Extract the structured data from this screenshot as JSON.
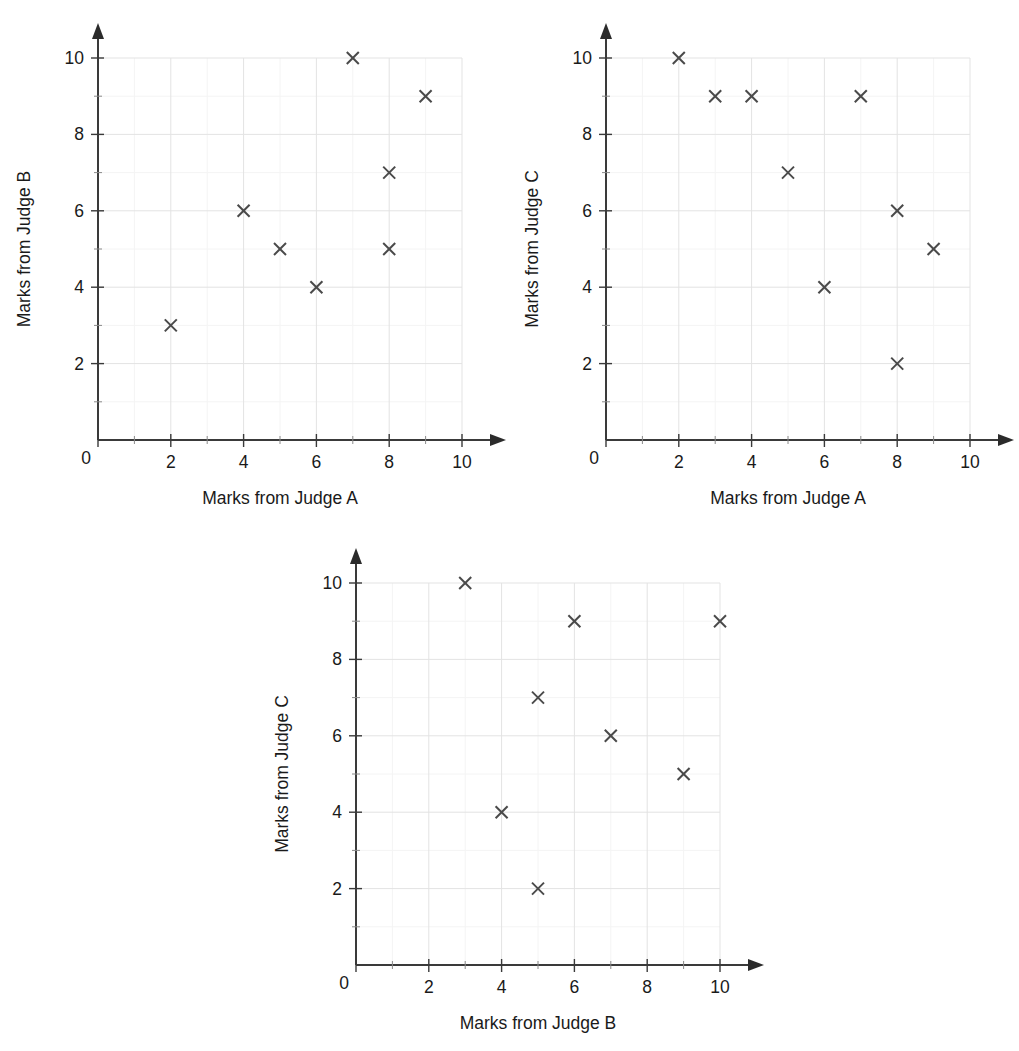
{
  "page": {
    "background": "#ffffff",
    "marker_color": "#4a4a4a",
    "axis_color": "#3a3a3a",
    "grid_major_color": "#e3e3e3",
    "grid_minor_color": "#f4f4f4",
    "text_color": "#1a1a1a"
  },
  "chart_data": [
    {
      "id": "chart-judge-a-vs-b",
      "type": "scatter",
      "title": "",
      "xlabel": "Marks from Judge A",
      "ylabel": "Marks from Judge B",
      "xlim": [
        0,
        10
      ],
      "ylim": [
        0,
        10
      ],
      "xticks": [
        0,
        2,
        4,
        6,
        8,
        10
      ],
      "yticks": [
        0,
        2,
        4,
        6,
        8,
        10
      ],
      "xtick_labels": [
        "0",
        "2",
        "4",
        "6",
        "8",
        "10"
      ],
      "ytick_labels": [
        "0",
        "2",
        "4",
        "6",
        "8",
        "10"
      ],
      "minor_ticks": [
        1,
        3,
        5,
        7,
        9
      ],
      "grid": true,
      "legend": "none",
      "marker": "x",
      "origin_label": "0",
      "points": [
        {
          "x": 2,
          "y": 3
        },
        {
          "x": 4,
          "y": 6
        },
        {
          "x": 5,
          "y": 5
        },
        {
          "x": 6,
          "y": 4
        },
        {
          "x": 7,
          "y": 10
        },
        {
          "x": 8,
          "y": 5
        },
        {
          "x": 8,
          "y": 7
        },
        {
          "x": 9,
          "y": 9
        }
      ]
    },
    {
      "id": "chart-judge-a-vs-c",
      "type": "scatter",
      "title": "",
      "xlabel": "Marks from Judge A",
      "ylabel": "Marks from Judge C",
      "xlim": [
        0,
        10
      ],
      "ylim": [
        0,
        10
      ],
      "xticks": [
        0,
        2,
        4,
        6,
        8,
        10
      ],
      "yticks": [
        0,
        2,
        4,
        6,
        8,
        10
      ],
      "xtick_labels": [
        "0",
        "2",
        "4",
        "6",
        "8",
        "10"
      ],
      "ytick_labels": [
        "0",
        "2",
        "4",
        "6",
        "8",
        "10"
      ],
      "minor_ticks": [
        1,
        3,
        5,
        7,
        9
      ],
      "grid": true,
      "legend": "none",
      "marker": "x",
      "origin_label": "0",
      "points": [
        {
          "x": 2,
          "y": 10
        },
        {
          "x": 3,
          "y": 9
        },
        {
          "x": 4,
          "y": 9
        },
        {
          "x": 5,
          "y": 7
        },
        {
          "x": 6,
          "y": 4
        },
        {
          "x": 7,
          "y": 9
        },
        {
          "x": 8,
          "y": 6
        },
        {
          "x": 8,
          "y": 2
        },
        {
          "x": 9,
          "y": 5
        }
      ]
    },
    {
      "id": "chart-judge-b-vs-c",
      "type": "scatter",
      "title": "",
      "xlabel": "Marks from Judge B",
      "ylabel": "Marks from Judge C",
      "xlim": [
        0,
        10
      ],
      "ylim": [
        0,
        10
      ],
      "xticks": [
        0,
        2,
        4,
        6,
        8,
        10
      ],
      "yticks": [
        0,
        2,
        4,
        6,
        8,
        10
      ],
      "xtick_labels": [
        "0",
        "2",
        "4",
        "6",
        "8",
        "10"
      ],
      "ytick_labels": [
        "0",
        "2",
        "4",
        "6",
        "8",
        "10"
      ],
      "minor_ticks": [
        1,
        3,
        5,
        7,
        9
      ],
      "grid": true,
      "legend": "none",
      "marker": "x",
      "origin_label": "0",
      "points": [
        {
          "x": 3,
          "y": 10
        },
        {
          "x": 4,
          "y": 4
        },
        {
          "x": 5,
          "y": 7
        },
        {
          "x": 5,
          "y": 2
        },
        {
          "x": 6,
          "y": 9
        },
        {
          "x": 7,
          "y": 6
        },
        {
          "x": 9,
          "y": 5
        },
        {
          "x": 10,
          "y": 9
        }
      ]
    }
  ],
  "layout": {
    "panels": [
      {
        "left": 0,
        "top": 0,
        "width": 512,
        "height": 510
      },
      {
        "left": 508,
        "top": 0,
        "width": 511,
        "height": 510
      },
      {
        "left": 258,
        "top": 525,
        "width": 512,
        "height": 526
      }
    ]
  }
}
